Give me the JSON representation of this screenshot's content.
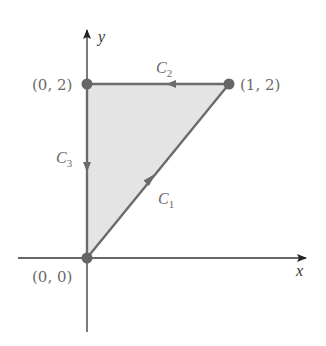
{
  "figure": {
    "type": "region-diagram"
  },
  "axes": {
    "x_label": "x",
    "y_label": "y"
  },
  "points": [
    {
      "name": "origin",
      "label": "(0, 0)",
      "x": 0,
      "y": 0
    },
    {
      "name": "top-left",
      "label": "(0, 2)",
      "x": 0,
      "y": 2
    },
    {
      "name": "top-right",
      "label": "(1, 2)",
      "x": 1,
      "y": 2
    }
  ],
  "curves": [
    {
      "name": "C1",
      "label_main": "C",
      "label_sub": "1",
      "from": "(0, 0)",
      "to": "(1, 2)"
    },
    {
      "name": "C2",
      "label_main": "C",
      "label_sub": "2",
      "from": "(1, 2)",
      "to": "(0, 2)"
    },
    {
      "name": "C3",
      "label_main": "C",
      "label_sub": "3",
      "from": "(0, 2)",
      "to": "(0, 0)"
    }
  ],
  "colors": {
    "region_fill": "#e4e4e4",
    "boundary": "#6b6b6b",
    "axis": "#333333",
    "point": "#666666",
    "label": "#6a6a6a"
  }
}
